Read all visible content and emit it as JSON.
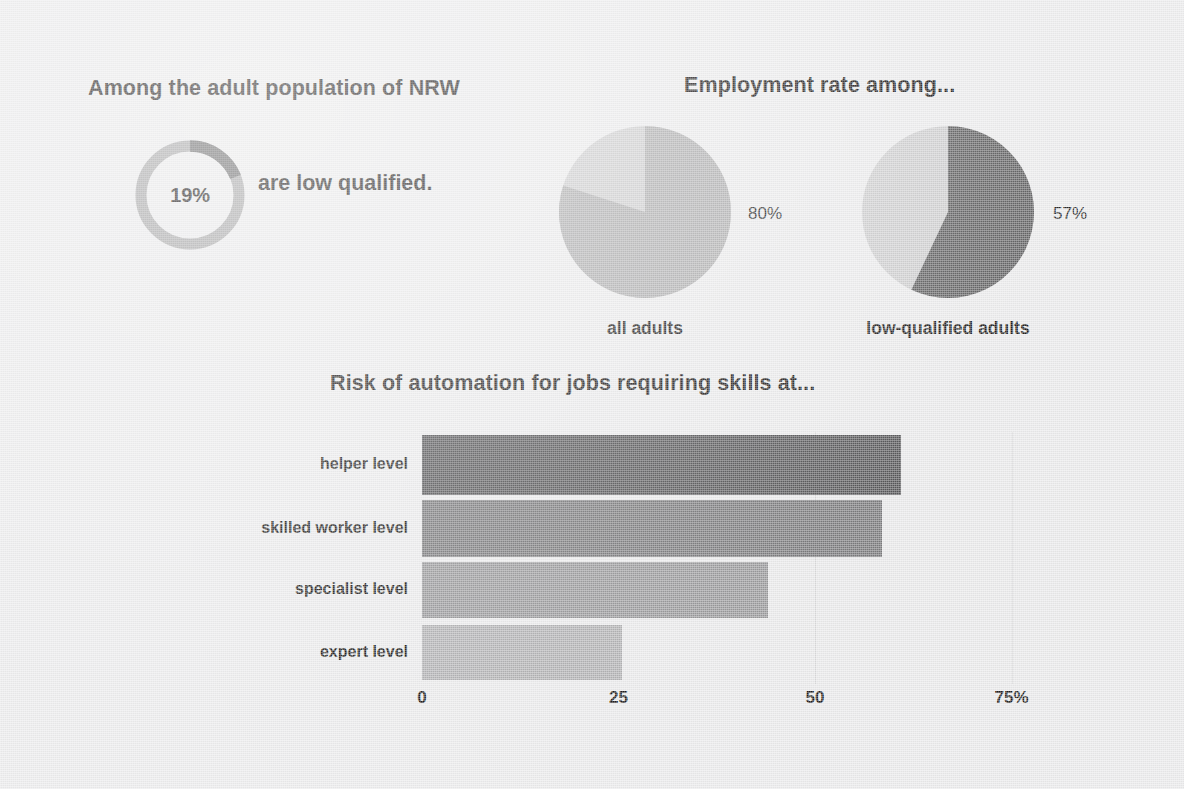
{
  "palette": {
    "background": "#ececed",
    "text": "#231f20",
    "donut_track": "#a9a9aa",
    "donut_value": "#6f6f70",
    "pie_light": "#cfcfd0",
    "pie_mid": "#b0b0b1",
    "pie_dark": "#636364",
    "bar_1": "#58585a",
    "bar_2": "#7c7c7e",
    "bar_3": "#9b9b9d",
    "bar_4": "#b4b4b6",
    "gridline": "#dcdcdd"
  },
  "donut_block": {
    "headline": "Among the adult population of NRW",
    "value_label": "19%",
    "sentence": "are low qualified."
  },
  "pies_block": {
    "headline": "Employment rate among...",
    "items": [
      {
        "label": "all adults",
        "pct_label": "80%"
      },
      {
        "label": "low-qualified adults",
        "pct_label": "57%"
      }
    ]
  },
  "bars_block": {
    "title": "Risk of automation for jobs requiring skills at...",
    "axis_ticks": [
      "0",
      "25",
      "50",
      "75%"
    ],
    "categories": [
      "helper level",
      "skilled worker level",
      "specialist level",
      "expert level"
    ]
  },
  "chart_data": [
    {
      "type": "pie",
      "title": "Among the adult population of NRW",
      "labels": [
        "low qualified",
        "not low qualified"
      ],
      "values": [
        19,
        81
      ],
      "data_labels": [
        "19%",
        ""
      ],
      "annotation": "are low qualified.",
      "donut": true,
      "start_angle_deg": 0,
      "direction": "clockwise",
      "colors": [
        "#6f6f70",
        "#a9a9aa"
      ],
      "legend": "none"
    },
    {
      "type": "pie",
      "title": "Employment rate among...",
      "subtitle": "all adults",
      "labels": [
        "employed",
        "not employed"
      ],
      "values": [
        80,
        20
      ],
      "data_labels": [
        "80%",
        ""
      ],
      "start_angle_deg": 0,
      "direction": "clockwise",
      "colors": [
        "#b0b0b1",
        "#cfcfd0"
      ],
      "legend": "none"
    },
    {
      "type": "pie",
      "title": "Employment rate among...",
      "subtitle": "low-qualified adults",
      "labels": [
        "employed",
        "not employed"
      ],
      "values": [
        57,
        43
      ],
      "data_labels": [
        "57%",
        ""
      ],
      "start_angle_deg": 0,
      "direction": "clockwise",
      "colors": [
        "#636364",
        "#cfcfd0"
      ],
      "legend": "none"
    },
    {
      "type": "bar",
      "orientation": "horizontal",
      "title": "Risk of automation for jobs requiring skills at...",
      "categories": [
        "helper level",
        "skilled worker level",
        "specialist level",
        "expert level"
      ],
      "values": [
        61,
        58.5,
        44,
        25.5
      ],
      "xlabel": "",
      "ylabel": "",
      "xlim": [
        0,
        83
      ],
      "xticks": [
        0,
        25,
        50,
        75
      ],
      "xtick_labels": [
        "0",
        "25",
        "50",
        "75%"
      ],
      "grid": "vertical-faint",
      "legend": "none",
      "colors": [
        "#58585a",
        "#7c7c7e",
        "#9b9b9d",
        "#b4b4b6"
      ]
    }
  ]
}
